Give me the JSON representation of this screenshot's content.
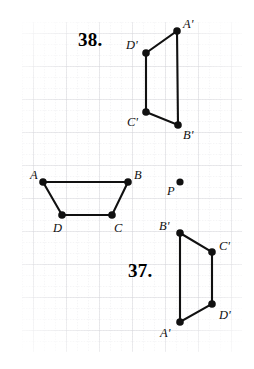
{
  "figure": {
    "type": "geometry-worksheet",
    "background_color": "#ffffff",
    "ink_color": "#111111",
    "grid": {
      "minor_color": "#e8e8ea",
      "major_color": "#d6d6da",
      "minor_spacing_px": 11,
      "major_every": 3,
      "origin_x": 22,
      "origin_y": 22,
      "width": 220,
      "height": 330
    },
    "problems": [
      {
        "id": "problem-38",
        "number": "38.",
        "x": 78,
        "y": 30
      },
      {
        "id": "problem-37",
        "number": "37.",
        "x": 128,
        "y": 261
      }
    ],
    "shapes": [
      {
        "id": "image-quadrilateral-38",
        "name": "A'B'C'D' image quadrilateral (problem 38)",
        "closed": true,
        "vertices": [
          {
            "label": "A'",
            "x": 177,
            "y": 31,
            "label_dx": 6,
            "label_dy": -13
          },
          {
            "label": "B'",
            "x": 178,
            "y": 125,
            "label_dx": 5,
            "label_dy": 4
          },
          {
            "label": "C'",
            "x": 146,
            "y": 112,
            "label_dx": -19,
            "label_dy": 4
          },
          {
            "label": "D'",
            "x": 146,
            "y": 53,
            "label_dx": -20,
            "label_dy": -14
          }
        ]
      },
      {
        "id": "preimage-trapezoid-ABCD",
        "name": "ABCD preimage trapezoid",
        "closed": true,
        "vertices": [
          {
            "label": "A",
            "x": 43,
            "y": 182,
            "label_dx": -13,
            "label_dy": -13
          },
          {
            "label": "B",
            "x": 128,
            "y": 182,
            "label_dx": 6,
            "label_dy": -13
          },
          {
            "label": "C",
            "x": 112,
            "y": 215,
            "label_dx": 2,
            "label_dy": 7
          },
          {
            "label": "D",
            "x": 62,
            "y": 215,
            "label_dx": -9,
            "label_dy": 7
          }
        ]
      },
      {
        "id": "image-quadrilateral-37",
        "name": "A'B'C'D' image quadrilateral (problem 37)",
        "closed": true,
        "vertices": [
          {
            "label": "B'",
            "x": 180,
            "y": 233,
            "label_dx": -21,
            "label_dy": -13
          },
          {
            "label": "C'",
            "x": 212,
            "y": 252,
            "label_dx": 7,
            "label_dy": -12
          },
          {
            "label": "D'",
            "x": 212,
            "y": 304,
            "label_dx": 7,
            "label_dy": 5
          },
          {
            "label": "A'",
            "x": 180,
            "y": 322,
            "label_dx": -20,
            "label_dy": 5
          }
        ]
      }
    ],
    "points": [
      {
        "id": "center-point-P",
        "label": "P",
        "x": 180,
        "y": 182,
        "label_dx": -13,
        "label_dy": 3,
        "radius": 3.6
      }
    ]
  }
}
